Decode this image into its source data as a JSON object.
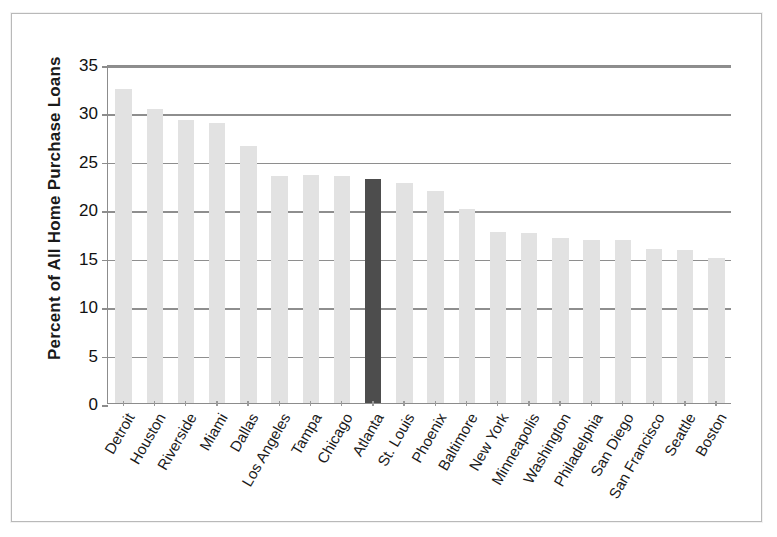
{
  "chart_data": {
    "type": "bar",
    "title": "",
    "xlabel": "",
    "ylabel": "Percent of All Home Purchase Loans",
    "ylim": [
      0,
      35
    ],
    "yticks": [
      0,
      5,
      10,
      15,
      20,
      25,
      30,
      35
    ],
    "ytick_labels": [
      "0",
      "5",
      "10",
      "15",
      "20",
      "25",
      "30",
      "35"
    ],
    "grid": true,
    "legend": "none",
    "categories": [
      "Detroit",
      "Houston",
      "Riverside",
      "Miami",
      "Dallas",
      "Los Angeles",
      "Tampa",
      "Chicago",
      "Atlanta",
      "St. Louis",
      "Phoenix",
      "Baltimore",
      "New York",
      "Minneapolis",
      "Washington",
      "Philadelphia",
      "San Diego",
      "San Francisco",
      "Seattle",
      "Boston"
    ],
    "values": [
      32.4,
      30.4,
      29.2,
      28.9,
      26.5,
      23.4,
      23.5,
      23.4,
      23.1,
      22.7,
      21.9,
      20.0,
      17.7,
      17.6,
      17.0,
      16.8,
      16.8,
      15.9,
      15.8,
      15.0
    ],
    "highlight_category": "Atlanta",
    "highlight_index": 8,
    "colors": {
      "bar": "#e2e2e2",
      "highlight_bar": "#4d4d4d",
      "gridline": "#8e8e8e",
      "axis": "#8c8c8c",
      "text": "#1a1a1a",
      "frame": "#b9b9b9",
      "background": "#ffffff"
    }
  }
}
